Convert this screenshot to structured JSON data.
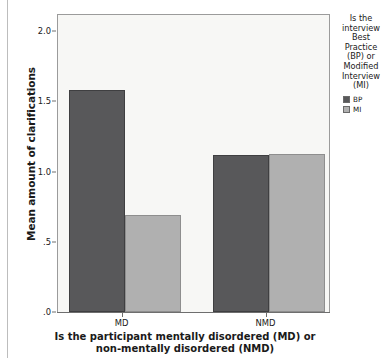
{
  "chart_data": {
    "type": "bar",
    "title": "",
    "subtitle": "",
    "xlabel": "Is the participant mentally disordered (MD) or non-mentally disordered (NMD)",
    "xlabel_line1": "Is the participant mentally disordered (MD) or",
    "xlabel_line2": "non-mentally disordered (NMD)",
    "ylabel": "Mean amount of clarifications",
    "categories": [
      "MD",
      "NMD"
    ],
    "series": [
      {
        "name": "BP",
        "color": "#58585a",
        "values": [
          1.59,
          1.12
        ]
      },
      {
        "name": "MI",
        "color": "#b0b0b0",
        "values": [
          0.69,
          1.13
        ]
      }
    ],
    "ylim": [
      0,
      2.13
    ],
    "yticks": [
      0,
      0.5,
      1.0,
      1.5,
      2.0
    ],
    "ytick_labels": [
      ".0",
      ".5",
      "1.0",
      "1.5",
      "2.0"
    ],
    "grid": false,
    "legend_position": "right",
    "legend": {
      "title": "Is the interview Best Practice (BP) or Modified Interview (MI)",
      "title_lines": [
        "Is the",
        "interview",
        "Best",
        "Practice",
        "(BP) or",
        "Modified",
        "Interview",
        "(MI)"
      ],
      "entries": [
        {
          "label": "BP",
          "color": "#58585a"
        },
        {
          "label": "MI",
          "color": "#b0b0b0"
        }
      ]
    },
    "colors": {
      "plot_background": "#f7f7f5",
      "frame": "#9b9b9b",
      "axis": "#6e6e6e",
      "text": "#1a1a1a",
      "page_rule": "#bdbdbd"
    }
  }
}
